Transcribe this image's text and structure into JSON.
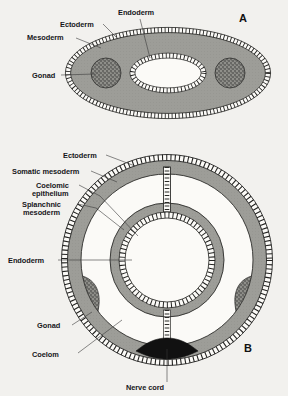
{
  "figure": {
    "background_color": "#f2f1ee",
    "ink_color": "#16161a",
    "mesoderm_fill": "#9a9a96",
    "gonad_fill": "#8d8d88",
    "nerve_cord_fill": "#111111",
    "cavity_fill": "#f7f6f3"
  },
  "panels": [
    {
      "id": "A",
      "letter": "A",
      "letter_pos": {
        "x": 243,
        "y": 22
      },
      "shape": "ellipse",
      "description": "Acoelomate-style oval cross section with solid mesoderm and central gut lumen",
      "labels": [
        {
          "name": "ectoderm",
          "text": "Ectoderm",
          "x": 60,
          "y": 27,
          "anchor": "start"
        },
        {
          "name": "mesoderm",
          "text": "Mesoderm",
          "x": 27,
          "y": 40,
          "anchor": "start"
        },
        {
          "name": "endoderm",
          "text": "Endoderm",
          "x": 118,
          "y": 15,
          "anchor": "start"
        },
        {
          "name": "gonad",
          "text": "Gonad",
          "x": 32,
          "y": 78,
          "anchor": "start"
        }
      ]
    },
    {
      "id": "B",
      "letter": "B",
      "letter_pos": {
        "x": 248,
        "y": 352
      },
      "shape": "circle",
      "description": "Coelomate circular cross section with somatic and splanchnic mesoderm separated by coelom",
      "labels": [
        {
          "name": "ectoderm",
          "text": "Ectoderm",
          "x": 63,
          "y": 158,
          "anchor": "start"
        },
        {
          "name": "somatic-mesoderm",
          "text": "Somatic mesoderm",
          "x": 12,
          "y": 174,
          "anchor": "start"
        },
        {
          "name": "coelomic-epithelium-line1",
          "text": "Coelomic",
          "x": 36,
          "y": 188,
          "anchor": "start"
        },
        {
          "name": "coelomic-epithelium-line2",
          "text": "epithelium",
          "x": 32,
          "y": 196,
          "anchor": "start"
        },
        {
          "name": "splanchnic-mesoderm-line1",
          "text": "Splanchnic",
          "x": 22,
          "y": 207,
          "anchor": "start"
        },
        {
          "name": "splanchnic-mesoderm-line2",
          "text": "mesoderm",
          "x": 23,
          "y": 215,
          "anchor": "start"
        },
        {
          "name": "endoderm",
          "text": "Endoderm",
          "x": 8,
          "y": 263,
          "anchor": "start"
        },
        {
          "name": "gonad",
          "text": "Gonad",
          "x": 37,
          "y": 328,
          "anchor": "start"
        },
        {
          "name": "coelom",
          "text": "Coelom",
          "x": 32,
          "y": 357,
          "anchor": "start"
        },
        {
          "name": "nerve-cord",
          "text": "Nerve cord",
          "x": 145,
          "y": 390,
          "anchor": "middle"
        }
      ]
    }
  ],
  "structures": {
    "ectoderm": "Ectoderm",
    "mesoderm": "Mesoderm",
    "endoderm": "Endoderm",
    "gonad": "Gonad",
    "coelom": "Coelom",
    "somatic_mesoderm": "Somatic mesoderm",
    "splanchnic_mesoderm": "Splanchnic mesoderm",
    "coelomic_epithelium": "Coelomic epithelium",
    "nerve_cord": "Nerve cord"
  }
}
